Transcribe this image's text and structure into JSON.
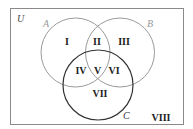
{
  "diagram": {
    "type": "venn",
    "universe_label": "U",
    "sets": [
      {
        "label": "A",
        "color": "#9a9a9a"
      },
      {
        "label": "B",
        "color": "#9a9a9a"
      },
      {
        "label": "C",
        "color": "#333333"
      }
    ],
    "regions": [
      "I",
      "II",
      "III",
      "IV",
      "V",
      "VI",
      "VII",
      "VIII"
    ],
    "border_color": "#8a8a8a"
  }
}
